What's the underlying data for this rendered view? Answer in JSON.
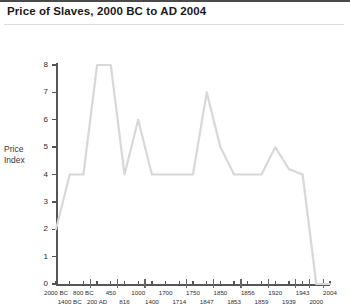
{
  "header": {
    "title": "Price of Slaves, 2000 BC to AD 2004"
  },
  "axis_title_x": "Year",
  "axis_label_y_line1": "Price",
  "axis_label_y_line2": "Index",
  "colors": {
    "line": "#d8d8d8",
    "axis": "#555555",
    "title_text": "#1a1a1a",
    "tick_text": "#2e2e2e",
    "background": "#ffffff"
  },
  "chart_data": {
    "type": "line",
    "title": "Price of Slaves, 2000 BC to AD 2004",
    "xlabel": "Year",
    "ylabel": "Price Index",
    "ylim": [
      0,
      8
    ],
    "yticks": [
      0,
      1,
      2,
      3,
      4,
      5,
      6,
      7,
      8
    ],
    "grid": false,
    "legend": "none",
    "categories": [
      "2000 BC",
      "1400 BC",
      "800 BC",
      "200 AD",
      "450",
      "816",
      "1000",
      "1400",
      "1700",
      "1714",
      "1750",
      "1847",
      "1850",
      "1853",
      "1856",
      "1859",
      "1920",
      "1939",
      "1943",
      "2000",
      "2004"
    ],
    "values": [
      2,
      4,
      4,
      8,
      8,
      4,
      6,
      4,
      4,
      4,
      4,
      7,
      5,
      4,
      4,
      4,
      5,
      4.2,
      4,
      0,
      0
    ],
    "tick_labels_top_row": [
      "2000 BC",
      "800 BC",
      "450",
      "1000",
      "1700",
      "1750",
      "1850",
      "1856",
      "1920",
      "1943",
      "2004"
    ],
    "tick_labels_bottom_row": [
      "1400 BC",
      "200 AD",
      "816",
      "1400",
      "1714",
      "1847",
      "1853",
      "1859",
      "1939",
      "2000"
    ]
  }
}
